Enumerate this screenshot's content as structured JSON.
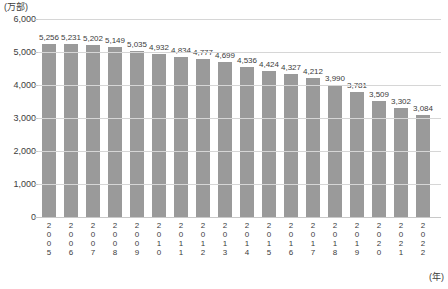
{
  "chart_data": {
    "type": "bar",
    "title": "",
    "subtitle": "",
    "xlabel": "(年)",
    "ylabel": "(万部)",
    "ylim": [
      0,
      6000
    ],
    "ytick_labels": [
      "6,000",
      "5,000",
      "4,000",
      "3,000",
      "2,000",
      "1,000",
      "0"
    ],
    "ytick_values": [
      6000,
      5000,
      4000,
      3000,
      2000,
      1000,
      0
    ],
    "grid": true,
    "legend": "none",
    "categories": [
      "2005",
      "2006",
      "2007",
      "2008",
      "2009",
      "2010",
      "2011",
      "2012",
      "2013",
      "2014",
      "2015",
      "2016",
      "2017",
      "2018",
      "2019",
      "2020",
      "2021",
      "2022"
    ],
    "values": [
      5256,
      5231,
      5202,
      5149,
      5035,
      4932,
      4834,
      4777,
      4699,
      4536,
      4424,
      4327,
      4212,
      3990,
      3781,
      3509,
      3302,
      3084
    ],
    "value_labels": [
      "5,256",
      "5,231",
      "5,202",
      "5,149",
      "5,035",
      "4,932",
      "4,834",
      "4,777",
      "4,699",
      "4,536",
      "4,424",
      "4,327",
      "4,212",
      "3,990",
      "3,781",
      "3,509",
      "3,302",
      "3,084"
    ],
    "bar_color": "#9a9a9a",
    "grid_color": "#d6d6d6",
    "background_color": "#ffffff",
    "text_color": "#3c3c3c"
  }
}
